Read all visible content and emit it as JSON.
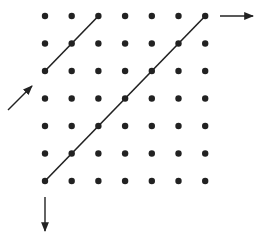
{
  "diagram": {
    "title": "",
    "grid": {
      "columns": 7,
      "rows": 7,
      "dot_color": "#222222"
    },
    "segments": [
      {
        "name": "short-diagonal",
        "from": [
          0,
          2
        ],
        "to": [
          2,
          0
        ]
      },
      {
        "name": "long-diagonal",
        "from": [
          0,
          6
        ],
        "to": [
          6,
          0
        ]
      }
    ],
    "arrows": [
      {
        "name": "entry-arrow-up-right",
        "direction": "up-right",
        "anchor": "left-of-row-3"
      },
      {
        "name": "exit-arrow-right",
        "direction": "right",
        "anchor": "right-of-row-0"
      },
      {
        "name": "exit-arrow-down",
        "direction": "down",
        "anchor": "below-column-0"
      }
    ],
    "line_color": "#222222"
  }
}
